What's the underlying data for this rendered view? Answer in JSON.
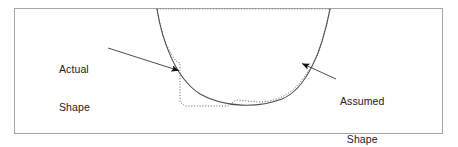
{
  "figure": {
    "kind": "technical-line-diagram",
    "frame": {
      "border_color": "#a6a6a6",
      "background_color": "#ffffff"
    },
    "annotations": [
      {
        "id": "actual",
        "line1": "Actual",
        "line2": "Shape",
        "target": "dotted-irregular-curve",
        "arrow_from": [
          108,
          48
        ],
        "arrow_to": [
          180,
          71
        ]
      },
      {
        "id": "assumed",
        "line1": "Assumed",
        "line2": "Shape",
        "target": "solid-smooth-curve",
        "arrow_from": [
          336,
          79
        ],
        "arrow_to": [
          301,
          63
        ]
      }
    ],
    "curves": [
      {
        "id": "assumed-shape-curve",
        "style": "solid",
        "color": "#4d4d4d",
        "width": 1.1,
        "path": "M157,9 C162,40 175,78 200,94 C225,108 258,108 282,99 C306,89 322,52 330,9"
      },
      {
        "id": "actual-shape-curve",
        "style": "dotted",
        "color": "#6b6b6b",
        "width": 1.0,
        "path": "M157,9 C161,34 168,52 177,62 L180,63 L180,102 L185,106 L228,106 L236,100 L258,102 C278,102 292,93 302,80 C312,66 318,58 321,44 C325,30 328,18 330,9"
      },
      {
        "id": "top-reference-dotted-line",
        "style": "dotted",
        "color": "#8a8a8a",
        "width": 1.0,
        "path": "M157,9 L330,9"
      }
    ]
  }
}
